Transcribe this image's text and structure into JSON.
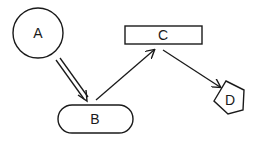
{
  "diagram": {
    "background": "#ffffff",
    "stroke_color": "#1a1a1a",
    "nodes": [
      {
        "id": "A",
        "label": "A",
        "shape": "circle",
        "cx": 38,
        "cy": 33,
        "r": 25
      },
      {
        "id": "B",
        "label": "B",
        "shape": "pill",
        "x": 58,
        "y": 105,
        "w": 75,
        "h": 28
      },
      {
        "id": "C",
        "label": "C",
        "shape": "rectangle",
        "x": 125,
        "y": 26,
        "w": 77,
        "h": 18
      },
      {
        "id": "D",
        "label": "D",
        "shape": "pentagon",
        "points": "226,81 244,90 243,110 228,114 214,101"
      }
    ],
    "edges": [
      {
        "from": "A",
        "to": "B",
        "style": "double-line-arrow"
      },
      {
        "from": "B",
        "to": "C",
        "style": "single-arrow"
      },
      {
        "from": "C",
        "to": "D",
        "style": "single-arrow"
      }
    ]
  }
}
